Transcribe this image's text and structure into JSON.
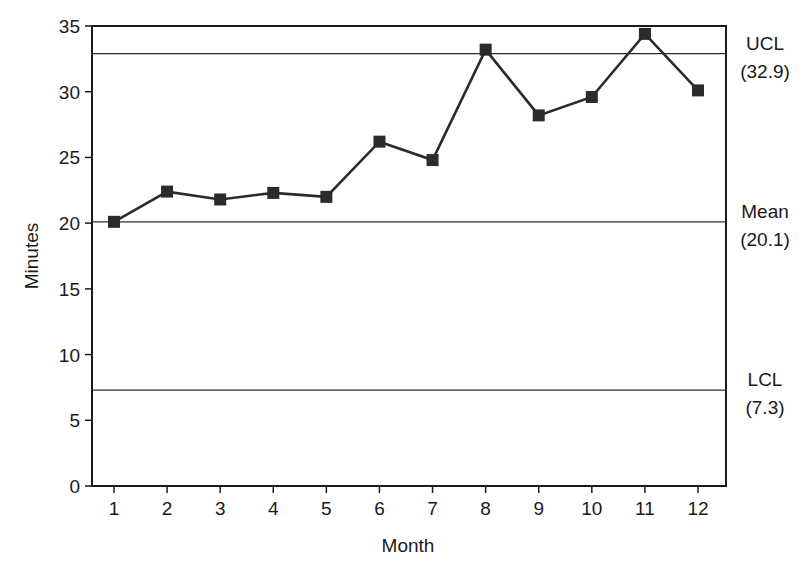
{
  "chart_data": {
    "type": "line",
    "title": "",
    "xlabel": "Month",
    "ylabel": "Minutes",
    "x": [
      1,
      2,
      3,
      4,
      5,
      6,
      7,
      8,
      9,
      10,
      11,
      12
    ],
    "categories": [
      "1",
      "2",
      "3",
      "4",
      "5",
      "6",
      "7",
      "8",
      "9",
      "10",
      "11",
      "12"
    ],
    "series": [
      {
        "name": "Minutes",
        "marker": "square",
        "values": [
          20.1,
          22.4,
          21.8,
          22.3,
          22.0,
          26.2,
          24.8,
          33.2,
          28.2,
          29.6,
          34.4,
          30.1
        ]
      }
    ],
    "reference_lines": [
      {
        "name": "UCL",
        "label": "UCL",
        "value_label": "(32.9)",
        "value": 32.9
      },
      {
        "name": "Mean",
        "label": "Mean",
        "value_label": "(20.1)",
        "value": 20.1
      },
      {
        "name": "LCL",
        "label": "LCL",
        "value_label": "(7.3)",
        "value": 7.3
      }
    ],
    "ylim": [
      0,
      35
    ],
    "yticks": [
      0,
      5,
      10,
      15,
      20,
      25,
      30,
      35
    ],
    "xlim": [
      0.58,
      12.52
    ],
    "grid": false,
    "legend": "none"
  },
  "colors": {
    "line": "#2b2b2b",
    "marker": "#2b2b2b",
    "axis": "#1a1a1a",
    "background": "#ffffff"
  }
}
